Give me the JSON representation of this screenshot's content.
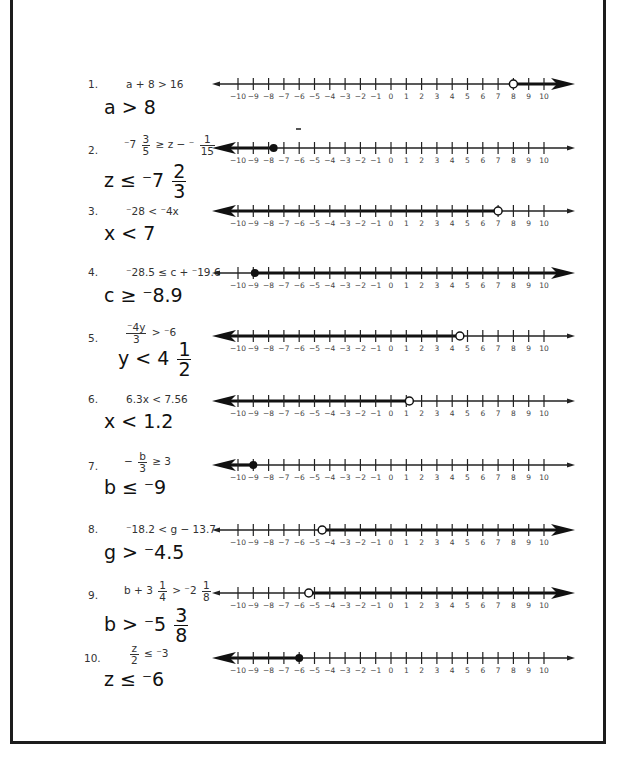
{
  "worksheet": {
    "axis": {
      "min": -10,
      "max": 10,
      "tick_labels": [
        "−10",
        "−9",
        "−8",
        "−7",
        "−6",
        "−5",
        "−4",
        "−3",
        "−2",
        "−1",
        "0",
        "1",
        "2",
        "3",
        "4",
        "5",
        "6",
        "7",
        "8",
        "9",
        "10"
      ]
    },
    "problems": [
      {
        "number": "1.",
        "equation": "a + 8 > 16",
        "answer": "a > 8",
        "endpoint": 8,
        "closed": false,
        "direction": "right",
        "top": 70
      },
      {
        "number": "2.",
        "equation_parts": [
          "⁻7",
          "3",
          "5",
          "≥ z − ⁻",
          "1",
          "15"
        ],
        "answer_parts": [
          "z ≤ ⁻7",
          "2",
          "3"
        ],
        "endpoint": -7.67,
        "closed": true,
        "direction": "left",
        "top": 134
      },
      {
        "number": "3.",
        "equation": "⁻28 < ⁻4x",
        "answer": "x < 7",
        "endpoint": 7,
        "closed": false,
        "direction": "left",
        "top": 198
      },
      {
        "number": "4.",
        "equation": "⁻28.5 ≤ c + ⁻19.6",
        "answer": "c ≥ ⁻8.9",
        "endpoint": -8.9,
        "closed": true,
        "direction": "right",
        "top": 260
      },
      {
        "number": "5.",
        "equation_parts": [
          "⁻4y",
          "3",
          "> ⁻6"
        ],
        "answer_parts": [
          "y < 4",
          "1",
          "2"
        ],
        "endpoint": 4.5,
        "closed": false,
        "direction": "left",
        "top": 322
      },
      {
        "number": "6.",
        "equation": "6.3x < 7.56",
        "answer": "x < 1.2",
        "endpoint": 1.2,
        "closed": false,
        "direction": "left",
        "top": 388
      },
      {
        "number": "7.",
        "equation_parts": [
          "−",
          "b",
          "3",
          "≥ 3"
        ],
        "answer": "b ≤ ⁻9",
        "endpoint": -9,
        "closed": true,
        "direction": "left",
        "top": 452
      },
      {
        "number": "8.",
        "equation": "⁻18.2 < g − 13.7",
        "answer": "g > ⁻4.5",
        "endpoint": -4.5,
        "closed": false,
        "direction": "right",
        "top": 517
      },
      {
        "number": "9.",
        "equation_parts": [
          "b + 3",
          "1",
          "4",
          "> ⁻2",
          "1",
          "8"
        ],
        "answer_parts": [
          "b > ⁻5",
          "3",
          "8"
        ],
        "endpoint": -5.375,
        "closed": false,
        "direction": "right",
        "top": 580
      },
      {
        "number": "10.",
        "equation_parts": [
          "z",
          "2",
          "≤ ⁻3"
        ],
        "answer": "z ≤ ⁻6",
        "endpoint": -6,
        "closed": true,
        "direction": "left",
        "top": 644
      }
    ]
  }
}
